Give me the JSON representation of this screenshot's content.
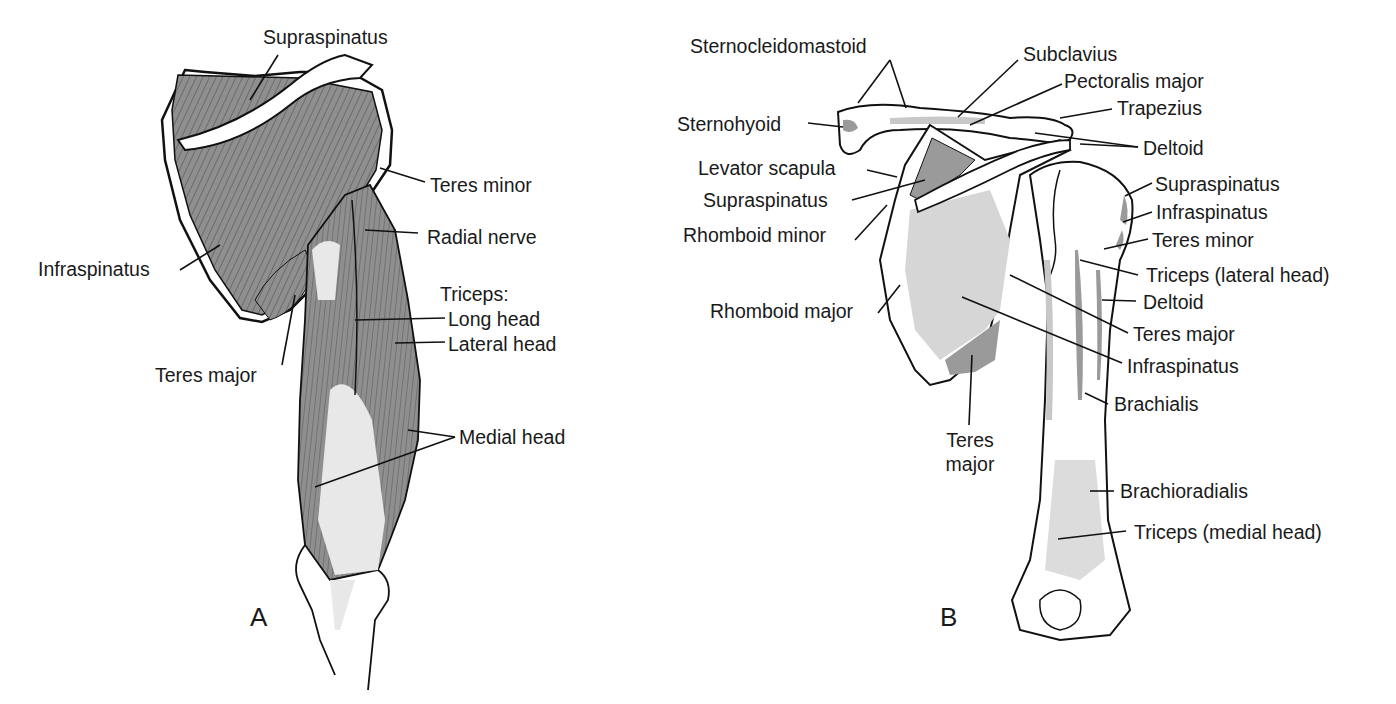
{
  "figure": {
    "panels": [
      {
        "id": "A",
        "letter": "A",
        "view": "posterior shoulder and arm muscles",
        "labels": {
          "supraspinatus": "Supraspinatus",
          "teres_minor": "Teres minor",
          "radial_nerve": "Radial nerve",
          "infraspinatus": "Infraspinatus",
          "triceps": "Triceps:",
          "long_head": "Long head",
          "lateral_head": "Lateral head",
          "teres_major": "Teres major",
          "medial_head": "Medial head"
        }
      },
      {
        "id": "B",
        "letter": "B",
        "view": "posterior scapula, clavicle and humerus muscle attachments",
        "labels": {
          "sternocleidomastoid": "Sternocleidomastoid",
          "subclavius": "Subclavius",
          "pectoralis_major": "Pectoralis major",
          "trapezius": "Trapezius",
          "sternohyoid": "Sternohyoid",
          "deltoid_top": "Deltoid",
          "levator_scapula": "Levator scapula",
          "supraspinatus_left": "Supraspinatus",
          "rhomboid_minor": "Rhomboid minor",
          "supraspinatus_right": "Supraspinatus",
          "infraspinatus_right": "Infraspinatus",
          "teres_minor": "Teres minor",
          "triceps_lateral": "Triceps (lateral head)",
          "deltoid_mid": "Deltoid",
          "rhomboid_major": "Rhomboid major",
          "teres_major_right": "Teres major",
          "infraspinatus_mid": "Infraspinatus",
          "brachialis": "Brachialis",
          "teres_major_bottom_1": "Teres",
          "teres_major_bottom_2": "major",
          "brachioradialis": "Brachioradialis",
          "triceps_medial": "Triceps (medial head)"
        }
      }
    ],
    "colors": {
      "muscle_dark": "#8f8f8f",
      "muscle_light": "#d6d6d6",
      "outline": "#111111",
      "background": "#ffffff"
    }
  }
}
